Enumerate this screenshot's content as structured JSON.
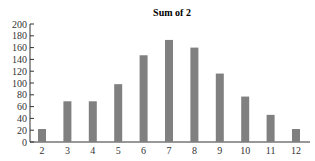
{
  "chart_data": {
    "type": "bar",
    "title": "Sum of 2",
    "xlabel": "",
    "ylabel": "",
    "categories": [
      "2",
      "3",
      "4",
      "5",
      "6",
      "7",
      "8",
      "9",
      "10",
      "11",
      "12"
    ],
    "values": [
      22,
      69,
      69,
      98,
      147,
      173,
      160,
      116,
      77,
      46,
      22
    ],
    "ylim": [
      0,
      200
    ],
    "yticks": [
      0,
      20,
      40,
      60,
      80,
      100,
      120,
      140,
      160,
      180,
      200
    ],
    "grid": false,
    "legend": null,
    "bar_color": "#808080",
    "axis_color": "#333333"
  }
}
